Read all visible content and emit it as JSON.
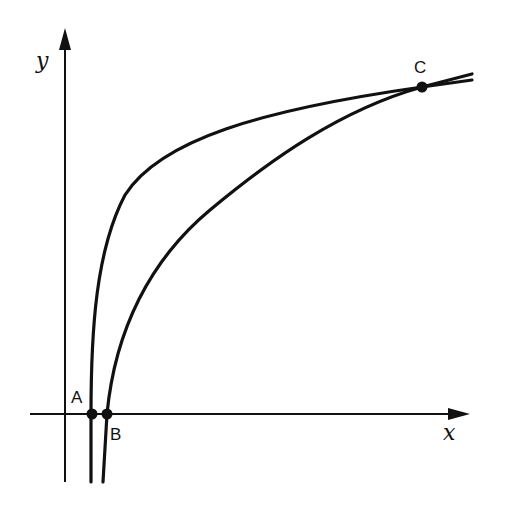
{
  "diagram": {
    "axes": {
      "x_label": "x",
      "y_label": "y"
    },
    "points": [
      {
        "label": "A",
        "description": "x-intercept of first (steeper) curve"
      },
      {
        "label": "B",
        "description": "x-intercept of second curve"
      },
      {
        "label": "C",
        "description": "intersection of the two curves"
      }
    ],
    "curves": [
      {
        "name": "curve-1",
        "passes_through": [
          "A",
          "C"
        ]
      },
      {
        "name": "curve-2",
        "passes_through": [
          "B",
          "C"
        ]
      }
    ],
    "colors": {
      "stroke": "#111111",
      "background": "#ffffff"
    }
  }
}
